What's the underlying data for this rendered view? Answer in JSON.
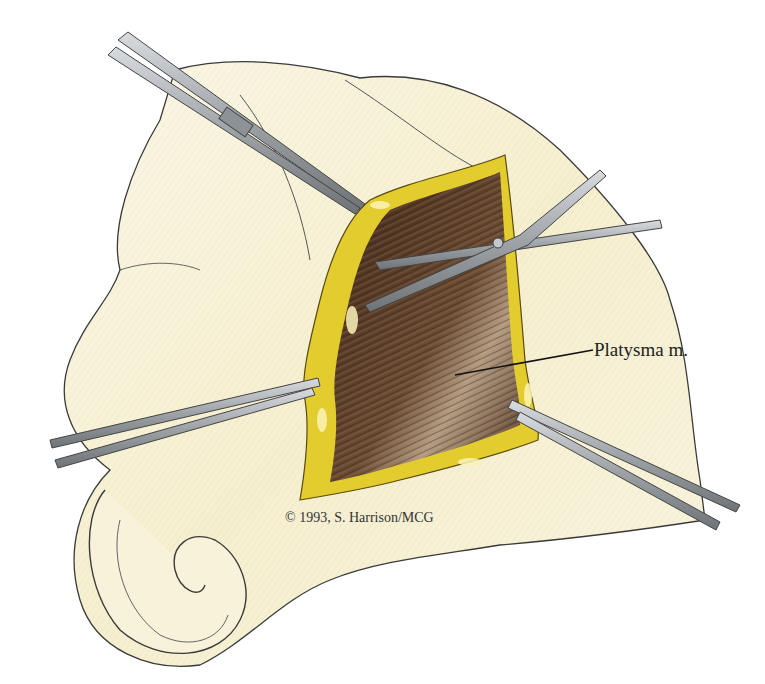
{
  "figure": {
    "labels": [
      {
        "text": "Platysma m.",
        "target": "exposed muscle fibers"
      }
    ],
    "credit": "© 1993, S. Harrison/MCG",
    "colors": {
      "background": "#ffffff",
      "skin": "#f7f1d8",
      "fat": "#e6d03a",
      "muscle": "#5a3a24",
      "muscle_highlight": "#c9b49a",
      "instrument": "#a9adb2",
      "outline": "#333333"
    },
    "instruments": [
      {
        "name": "forceps-upper-left"
      },
      {
        "name": "scissors-upper-right"
      },
      {
        "name": "forceps-left"
      },
      {
        "name": "forceps-lower-right"
      }
    ]
  }
}
